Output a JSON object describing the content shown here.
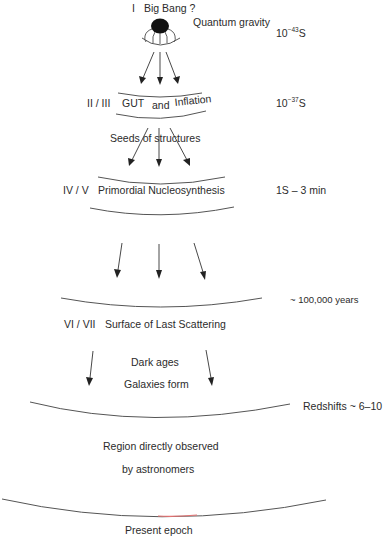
{
  "diagram": {
    "stages": [
      {
        "numeral": "I",
        "label": "Big Bang ?",
        "note": "Quantum gravity",
        "time_base": "10",
        "time_exp": "−43",
        "time_unit": "S"
      },
      {
        "numeral": "II / III",
        "label_parts": [
          "GUT",
          "and",
          "Inflation"
        ],
        "note": "Seeds of structures",
        "time_base": "10",
        "time_exp": "−37",
        "time_unit": "S"
      },
      {
        "numeral": "IV / V",
        "label": "Primordial Nucleosynthesis",
        "time": "1S – 3 min"
      },
      {
        "numeral": "VI / VII",
        "label": "Surface of Last Scattering",
        "time": "~ 100,000 years"
      },
      {
        "label_lines": [
          "Dark ages",
          "Galaxies form"
        ],
        "time": "Redshifts ~ 6–10"
      },
      {
        "label_lines": [
          "Region directly observed",
          "by astronomers"
        ]
      },
      {
        "label": "Present epoch"
      }
    ],
    "colors": {
      "text": "#2b2b2b",
      "arc": "#555555",
      "arc_highlight": "#e57373",
      "blob": "#111111"
    }
  }
}
